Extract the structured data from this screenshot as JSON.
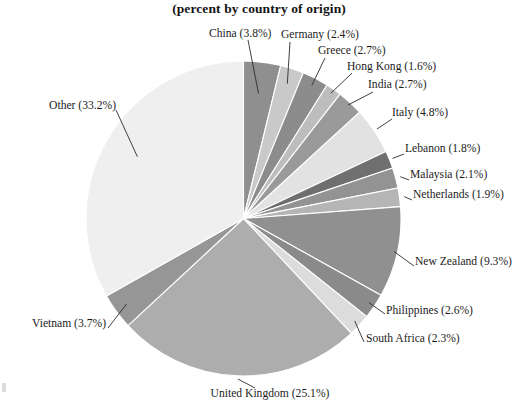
{
  "title": "(percent by country of origin)",
  "chart_data": {
    "type": "pie",
    "title": "(percent by country of origin)",
    "subtitle": "",
    "xlabel": "",
    "ylabel": "",
    "legend_position": "none",
    "grid": false,
    "units": "percent",
    "start_angle_deg": 0,
    "direction": "clockwise",
    "categories": [
      "China",
      "Germany",
      "Greece",
      "Hong Kong",
      "India",
      "Italy",
      "Lebanon",
      "Malaysia",
      "Netherlands",
      "New Zealand",
      "Philippines",
      "South Africa",
      "United Kingdom",
      "Vietnam",
      "Other"
    ],
    "values": [
      3.8,
      2.4,
      2.7,
      1.6,
      2.7,
      4.8,
      1.8,
      2.1,
      1.9,
      9.3,
      2.6,
      2.3,
      25.1,
      3.7,
      33.2
    ],
    "slices": [
      {
        "label": "China",
        "value": 3.8,
        "text": "China (3.8%)",
        "color": "#8f8f8f"
      },
      {
        "label": "Germany",
        "value": 2.4,
        "text": "Germany (2.4%)",
        "color": "#c9c9c9"
      },
      {
        "label": "Greece",
        "value": 2.7,
        "text": "Greece (2.7%)",
        "color": "#8c8c8c"
      },
      {
        "label": "Hong Kong",
        "value": 1.6,
        "text": "Hong Kong (1.6%)",
        "color": "#bdbdbd"
      },
      {
        "label": "India",
        "value": 2.7,
        "text": "India (2.7%)",
        "color": "#9a9a9a"
      },
      {
        "label": "Italy",
        "value": 4.8,
        "text": "Italy (4.8%)",
        "color": "#e2e2e2"
      },
      {
        "label": "Lebanon",
        "value": 1.8,
        "text": "Lebanon (1.8%)",
        "color": "#6f6f6f"
      },
      {
        "label": "Malaysia",
        "value": 2.1,
        "text": "Malaysia (2.1%)",
        "color": "#939393"
      },
      {
        "label": "Netherlands",
        "value": 1.9,
        "text": "Netherlands (1.9%)",
        "color": "#b5b5b5"
      },
      {
        "label": "New Zealand",
        "value": 9.3,
        "text": "New Zealand (9.3%)",
        "color": "#909090"
      },
      {
        "label": "Philippines",
        "value": 2.6,
        "text": "Philippines (2.6%)",
        "color": "#8a8a8a"
      },
      {
        "label": "South Africa",
        "value": 2.3,
        "text": "South Africa (2.3%)",
        "color": "#dcdcdc"
      },
      {
        "label": "United Kingdom",
        "value": 25.1,
        "text": "United Kingdom (25.1%)",
        "color": "#adadad"
      },
      {
        "label": "Vietnam",
        "value": 3.7,
        "text": "Vietnam (3.7%)",
        "color": "#969696"
      },
      {
        "label": "Other",
        "value": 33.2,
        "text": "Other (33.2%)",
        "color": "#efefef"
      }
    ]
  },
  "labels": {
    "china": "China (3.8%)",
    "germany": "Germany (2.4%)",
    "greece": "Greece (2.7%)",
    "hong_kong": "Hong Kong (1.6%)",
    "india": "India (2.7%)",
    "italy": "Italy (4.8%)",
    "lebanon": "Lebanon (1.8%)",
    "malaysia": "Malaysia (2.1%)",
    "netherlands": "Netherlands (1.9%)",
    "new_zealand": "New Zealand (9.3%)",
    "philippines": "Philippines (2.6%)",
    "south_africa": "South Africa (2.3%)",
    "united_kingdom": "United Kingdom (25.1%)",
    "vietnam": "Vietnam (3.7%)",
    "other": "Other (33.2%)"
  }
}
